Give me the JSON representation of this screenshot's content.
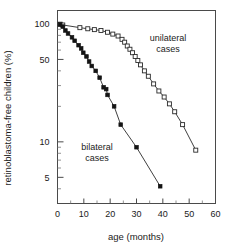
{
  "chart_data": {
    "type": "line",
    "title": "",
    "xlabel": "age (months)",
    "ylabel": "retinoblastoma-free children (%)",
    "xlim": [
      0,
      60
    ],
    "ylim": [
      3,
      130
    ],
    "yscale": "log",
    "xscale": "linear",
    "grid": false,
    "legend_position": "inline-annotation",
    "x_ticks": [
      0,
      10,
      20,
      30,
      40,
      50,
      60
    ],
    "x_tick_labels": [
      "0",
      "10",
      "20",
      "30",
      "40",
      "50",
      "60"
    ],
    "x_minor_ticks": [
      5,
      15,
      25,
      35,
      45,
      55
    ],
    "y_ticks": [
      100,
      50,
      10,
      5
    ],
    "y_tick_labels": [
      "100",
      "50",
      "10",
      "5"
    ],
    "y_minor_ticks": [
      90,
      80,
      70,
      60,
      40,
      30,
      20,
      9,
      8,
      7,
      6,
      4
    ],
    "annotations": [
      {
        "text": "unilateral cases",
        "x": 42,
        "y": 72,
        "lines": [
          "unilateral",
          "cases"
        ]
      },
      {
        "text": "bilateral cases",
        "x": 15,
        "y": 8.5,
        "lines": [
          "bilateral",
          "cases"
        ]
      }
    ],
    "series": [
      {
        "name": "unilateral cases",
        "marker": "open-square",
        "color": "#2a2a2a",
        "points": [
          [
            1.0,
            99.5
          ],
          [
            2.0,
            98.0
          ],
          [
            8.5,
            93.0
          ],
          [
            11.5,
            91.0
          ],
          [
            14.0,
            89.5
          ],
          [
            16.5,
            88.0
          ],
          [
            19.0,
            85.0
          ],
          [
            21.0,
            82.0
          ],
          [
            23.0,
            79.0
          ],
          [
            24.5,
            74.0
          ],
          [
            25.5,
            70.0
          ],
          [
            26.5,
            65.0
          ],
          [
            27.5,
            61.0
          ],
          [
            28.5,
            57.0
          ],
          [
            29.5,
            53.0
          ],
          [
            30.5,
            49.0
          ],
          [
            31.5,
            45.0
          ],
          [
            33.0,
            40.0
          ],
          [
            34.5,
            36.0
          ],
          [
            36.5,
            31.0
          ],
          [
            38.5,
            27.0
          ],
          [
            40.5,
            24.0
          ],
          [
            42.5,
            21.0
          ],
          [
            44.5,
            18.0
          ],
          [
            47.5,
            14.0
          ],
          [
            52.5,
            8.5
          ]
        ]
      },
      {
        "name": "bilateral cases",
        "marker": "filled-square",
        "color": "#141414",
        "points": [
          [
            1.0,
            99.0
          ],
          [
            2.0,
            95.0
          ],
          [
            3.0,
            88.0
          ],
          [
            4.0,
            83.0
          ],
          [
            5.5,
            77.0
          ],
          [
            6.5,
            72.0
          ],
          [
            8.0,
            66.0
          ],
          [
            9.0,
            62.0
          ],
          [
            9.8,
            57.0
          ],
          [
            11.0,
            53.0
          ],
          [
            12.0,
            48.0
          ],
          [
            13.0,
            44.0
          ],
          [
            14.5,
            40.0
          ],
          [
            16.0,
            35.0
          ],
          [
            17.5,
            29.0
          ],
          [
            18.5,
            28.0
          ],
          [
            19.0,
            25.0
          ],
          [
            21.5,
            20.0
          ],
          [
            24.0,
            14.0
          ],
          [
            30.0,
            9.0
          ],
          [
            39.0,
            4.2
          ]
        ]
      }
    ]
  },
  "axes": {
    "xlabel": "age (months)",
    "ylabel": "retinoblastoma-free children (%)"
  }
}
